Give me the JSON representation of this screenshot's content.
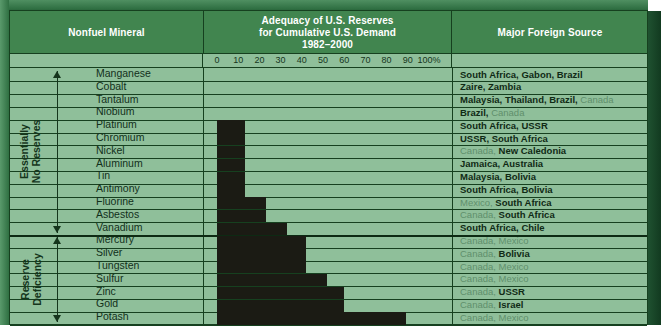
{
  "header": {
    "col1_title": "Nonfuel Mineral",
    "col2_title": "Adequacy of U.S. Reserves\nfor Cumulative U.S. Demand\n1982–2000",
    "col2_line1": "Adequacy of U.S. Reserves",
    "col2_line2": "for Cumulative U.S. Demand",
    "col2_line3": "1982–2000",
    "col3_title": "Major Foreign Source"
  },
  "sections": [
    {
      "label_line1": "Essentially",
      "label_line2": "No Reserves"
    },
    {
      "label_line1": "Reserve",
      "label_line2": "Deficiency"
    }
  ],
  "colors": {
    "frame": "#2d6b3f",
    "header_band": "#41854f",
    "table_bg": "#8fbf9a",
    "gridline": "#16401f",
    "bar": "#1b1b14",
    "bold_text": "#0f2a15",
    "light_text": "#5f8f6c"
  },
  "chart_data": {
    "type": "bar",
    "title": "Adequacy of U.S. Reserves for Cumulative U.S. Demand 1982–2000",
    "xlabel": "",
    "ylabel": "Nonfuel Mineral",
    "orientation": "horizontal",
    "xlim": [
      0,
      100
    ],
    "grid": true,
    "legend": "none",
    "tick_labels": [
      "0",
      "10",
      "20",
      "30",
      "40",
      "50",
      "60",
      "70",
      "80",
      "90",
      "100%"
    ],
    "tick_values": [
      0,
      10,
      20,
      30,
      40,
      50,
      60,
      70,
      80,
      90,
      100
    ],
    "categories": [
      "Manganese",
      "Cobalt",
      "Tantalum",
      "Niobium",
      "Platinum",
      "Chromium",
      "Nickel",
      "Aluminum",
      "Tin",
      "Antimony",
      "Fluorine",
      "Asbestos",
      "Vanadium",
      "Mercury",
      "Silver",
      "Tungsten",
      "Sulfur",
      "Zinc",
      "Gold",
      "Potash"
    ],
    "values": [
      0,
      0,
      0,
      0,
      13,
      13,
      13,
      13,
      13,
      13,
      23,
      23,
      33,
      42,
      42,
      42,
      52,
      60,
      60,
      89
    ],
    "section_breaks": [
      {
        "after_category": "Vanadium",
        "label": "Essentially No Reserves",
        "rows": 13
      },
      {
        "after_category": "Potash",
        "label": "Reserve Deficiency",
        "rows": 7
      }
    ]
  },
  "rows": [
    {
      "mineral": "Manganese",
      "value": 0,
      "sources": [
        {
          "t": "South Africa, Gabon, Brazil",
          "bold": true
        }
      ]
    },
    {
      "mineral": "Cobalt",
      "value": 0,
      "sources": [
        {
          "t": "Zaire, Zambia",
          "bold": true
        }
      ]
    },
    {
      "mineral": "Tantalum",
      "value": 0,
      "sources": [
        {
          "t": "Malaysia, Thailand, Brazil,",
          "bold": true
        },
        {
          "t": " Canada",
          "bold": false
        }
      ]
    },
    {
      "mineral": "Niobium",
      "value": 0,
      "sources": [
        {
          "t": "Brazil,",
          "bold": true
        },
        {
          "t": " Canada",
          "bold": false
        }
      ]
    },
    {
      "mineral": "Platinum",
      "value": 13,
      "sources": [
        {
          "t": "South Africa, USSR",
          "bold": true
        }
      ]
    },
    {
      "mineral": "Chromium",
      "value": 13,
      "sources": [
        {
          "t": "USSR, South Africa",
          "bold": true
        }
      ]
    },
    {
      "mineral": "Nickel",
      "value": 13,
      "sources": [
        {
          "t": "Canada,",
          "bold": false
        },
        {
          "t": " New Caledonia",
          "bold": true
        }
      ]
    },
    {
      "mineral": "Aluminum",
      "value": 13,
      "sources": [
        {
          "t": "Jamaica, Australia",
          "bold": true
        }
      ]
    },
    {
      "mineral": "Tin",
      "value": 13,
      "sources": [
        {
          "t": "Malaysia, Bolivia",
          "bold": true
        }
      ]
    },
    {
      "mineral": "Antimony",
      "value": 13,
      "sources": [
        {
          "t": "South Africa, Bolivia",
          "bold": true
        }
      ]
    },
    {
      "mineral": "Fluorine",
      "value": 23,
      "sources": [
        {
          "t": "Mexico,",
          "bold": false
        },
        {
          "t": " South Africa",
          "bold": true
        }
      ]
    },
    {
      "mineral": "Asbestos",
      "value": 23,
      "sources": [
        {
          "t": "Canada,",
          "bold": false
        },
        {
          "t": " South Africa",
          "bold": true
        }
      ]
    },
    {
      "mineral": "Vanadium",
      "value": 33,
      "sources": [
        {
          "t": "South Africa, Chile",
          "bold": true
        }
      ]
    },
    {
      "mineral": "Mercury",
      "value": 42,
      "sources": [
        {
          "t": "Canada, Mexico",
          "bold": false
        }
      ]
    },
    {
      "mineral": "Silver",
      "value": 42,
      "sources": [
        {
          "t": "Canada,",
          "bold": false
        },
        {
          "t": " Bolivia",
          "bold": true
        }
      ]
    },
    {
      "mineral": "Tungsten",
      "value": 42,
      "sources": [
        {
          "t": "Canada, Mexico",
          "bold": false
        }
      ]
    },
    {
      "mineral": "Sulfur",
      "value": 52,
      "sources": [
        {
          "t": "Canada, Mexico",
          "bold": false
        }
      ]
    },
    {
      "mineral": "Zinc",
      "value": 60,
      "sources": [
        {
          "t": "Canada,",
          "bold": false
        },
        {
          "t": " USSR",
          "bold": true
        }
      ]
    },
    {
      "mineral": "Gold",
      "value": 60,
      "sources": [
        {
          "t": "Canada,",
          "bold": false
        },
        {
          "t": " Israel",
          "bold": true
        }
      ]
    },
    {
      "mineral": "Potash",
      "value": 89,
      "sources": [
        {
          "t": "Canada, Mexico",
          "bold": false
        }
      ]
    }
  ]
}
